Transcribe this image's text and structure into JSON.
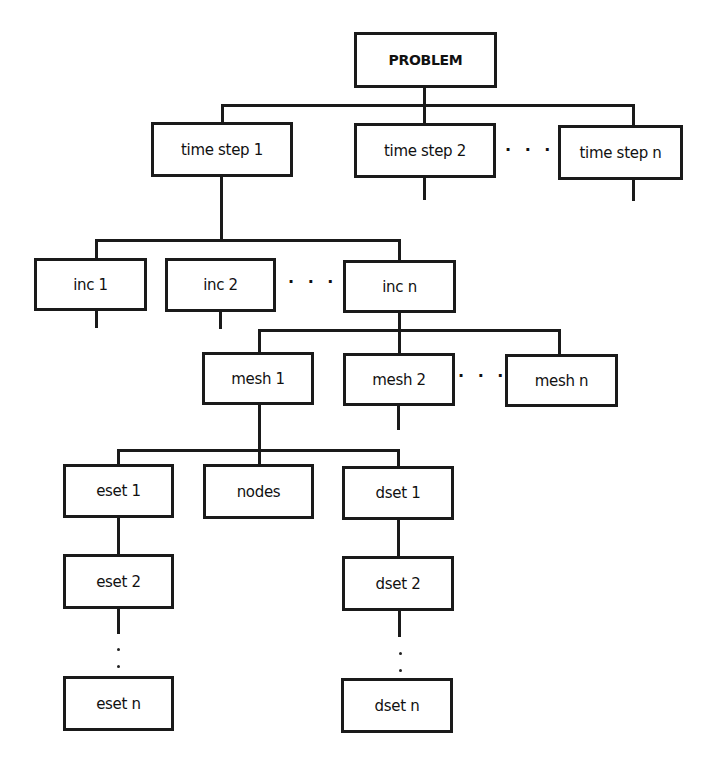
{
  "diagram": {
    "type": "tree",
    "root": "PROBLEM",
    "nodes": {
      "problem": "PROBLEM",
      "time_step_1": "time step 1",
      "time_step_2": "time step 2",
      "time_step_n": "time step n",
      "inc_1": "inc 1",
      "inc_2": "inc 2",
      "inc_n": "inc n",
      "mesh_1": "mesh 1",
      "mesh_2": "mesh 2",
      "mesh_n": "mesh n",
      "eset_1": "eset 1",
      "eset_2": "eset 2",
      "eset_n": "eset n",
      "nodes": "nodes",
      "dset_1": "dset 1",
      "dset_2": "dset 2",
      "dset_n": "dset n"
    },
    "ellipses": {
      "time_steps": "· · ·",
      "incs": "· · ·",
      "meshes": "· · ·"
    },
    "edges": [
      [
        "PROBLEM",
        "time step 1"
      ],
      [
        "PROBLEM",
        "time step 2"
      ],
      [
        "PROBLEM",
        "time step n"
      ],
      [
        "time step 1",
        "inc 1"
      ],
      [
        "time step 1",
        "inc 2"
      ],
      [
        "time step 1",
        "inc n"
      ],
      [
        "inc n",
        "mesh 1"
      ],
      [
        "inc n",
        "mesh 2"
      ],
      [
        "inc n",
        "mesh n"
      ],
      [
        "mesh 1",
        "eset 1"
      ],
      [
        "mesh 1",
        "nodes"
      ],
      [
        "mesh 1",
        "dset 1"
      ],
      [
        "eset 1",
        "eset 2"
      ],
      [
        "eset 2",
        "eset n"
      ],
      [
        "dset 1",
        "dset 2"
      ],
      [
        "dset 2",
        "dset n"
      ]
    ],
    "colors": {
      "stroke": "#1a1a1a",
      "background": "#ffffff",
      "text": "#111111"
    }
  }
}
